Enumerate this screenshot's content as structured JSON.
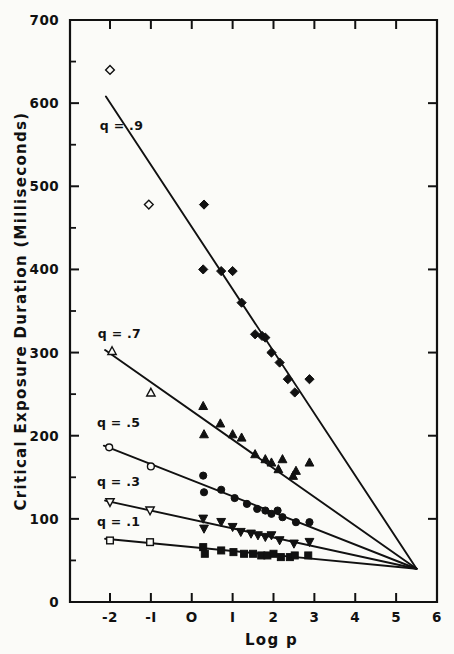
{
  "figure": {
    "background_color": "#fbfbf8",
    "ink_color": "#111111"
  },
  "chart_data": {
    "type": "scatter",
    "title": "",
    "xlabel": "Log p",
    "ylabel": "Critical Exposure Duration (Milliseconds)",
    "xlim": [
      -2.6,
      6.0
    ],
    "ylim": [
      0,
      700
    ],
    "xticks": [
      -2,
      -1,
      0,
      1,
      2,
      3,
      4,
      5,
      6
    ],
    "xticklabels": [
      "-2",
      "-I",
      "O",
      "I",
      "2",
      "3",
      "4",
      "5",
      "6"
    ],
    "yticks": [
      0,
      100,
      200,
      300,
      400,
      500,
      600,
      700
    ],
    "yticklabels": [
      "0",
      "100",
      "200",
      "300",
      "400",
      "500",
      "600",
      "700"
    ],
    "yminorticks": [
      50,
      150,
      250,
      350,
      450,
      550,
      650
    ],
    "grid": false,
    "legend_position": "inline-labels",
    "convergence_point": [
      5.5,
      40
    ],
    "series": [
      {
        "name": "q = .9",
        "label": "q = .9",
        "marker": "diamond",
        "label_x": -2.25,
        "label_y": 568,
        "line": [
          [
            -2.1,
            608
          ],
          [
            5.5,
            40
          ]
        ],
        "open_points": [
          [
            -2.0,
            640
          ],
          [
            -1.05,
            478
          ]
        ],
        "filled_points": [
          [
            0.3,
            478
          ],
          [
            0.28,
            400
          ],
          [
            0.72,
            398
          ],
          [
            1.0,
            398
          ],
          [
            1.22,
            360
          ],
          [
            1.55,
            322
          ],
          [
            1.72,
            320
          ],
          [
            1.8,
            318
          ],
          [
            1.95,
            300
          ],
          [
            2.15,
            288
          ],
          [
            2.35,
            268
          ],
          [
            2.52,
            252
          ],
          [
            2.88,
            268
          ]
        ]
      },
      {
        "name": "q = .7",
        "label": "q = .7",
        "marker": "triangle-up",
        "label_x": -2.3,
        "label_y": 318,
        "line": [
          [
            -2.12,
            303
          ],
          [
            5.5,
            40
          ]
        ],
        "open_points": [
          [
            -1.95,
            302
          ],
          [
            -1.0,
            252
          ]
        ],
        "filled_points": [
          [
            0.28,
            236
          ],
          [
            0.3,
            202
          ],
          [
            0.7,
            215
          ],
          [
            1.0,
            202
          ],
          [
            1.22,
            198
          ],
          [
            1.55,
            178
          ],
          [
            1.8,
            172
          ],
          [
            1.95,
            168
          ],
          [
            2.12,
            160
          ],
          [
            2.22,
            172
          ],
          [
            2.48,
            152
          ],
          [
            2.55,
            158
          ],
          [
            2.88,
            168
          ]
        ]
      },
      {
        "name": "q = .5",
        "label": "q = .5",
        "marker": "circle",
        "label_x": -2.32,
        "label_y": 210,
        "line": [
          [
            -2.15,
            188
          ],
          [
            5.5,
            40
          ]
        ],
        "open_points": [
          [
            -2.02,
            186
          ],
          [
            -1.0,
            163
          ]
        ],
        "filled_points": [
          [
            0.28,
            152
          ],
          [
            0.3,
            132
          ],
          [
            0.72,
            135
          ],
          [
            1.05,
            125
          ],
          [
            1.35,
            118
          ],
          [
            1.6,
            112
          ],
          [
            1.8,
            110
          ],
          [
            1.95,
            106
          ],
          [
            2.1,
            110
          ],
          [
            2.22,
            102
          ],
          [
            2.55,
            96
          ],
          [
            2.88,
            96
          ]
        ]
      },
      {
        "name": "q = .3",
        "label": "q = .3",
        "marker": "triangle-down",
        "label_x": -2.32,
        "label_y": 140,
        "line": [
          [
            -2.12,
            122
          ],
          [
            5.5,
            40
          ]
        ],
        "open_points": [
          [
            -2.0,
            120
          ],
          [
            -1.02,
            110
          ]
        ],
        "filled_points": [
          [
            0.28,
            100
          ],
          [
            0.3,
            88
          ],
          [
            0.72,
            96
          ],
          [
            1.0,
            90
          ],
          [
            1.2,
            84
          ],
          [
            1.45,
            82
          ],
          [
            1.62,
            80
          ],
          [
            1.8,
            78
          ],
          [
            1.95,
            80
          ],
          [
            2.15,
            74
          ],
          [
            2.5,
            70
          ],
          [
            2.88,
            72
          ]
        ]
      },
      {
        "name": "q = .1",
        "label": "q = .1",
        "marker": "square",
        "label_x": -2.32,
        "label_y": 92,
        "line": [
          [
            -2.12,
            76
          ],
          [
            5.5,
            40
          ]
        ],
        "open_points": [
          [
            -2.0,
            74
          ],
          [
            -1.02,
            72
          ]
        ],
        "filled_points": [
          [
            0.28,
            66
          ],
          [
            0.32,
            58
          ],
          [
            0.72,
            62
          ],
          [
            1.02,
            60
          ],
          [
            1.28,
            58
          ],
          [
            1.5,
            58
          ],
          [
            1.7,
            56
          ],
          [
            1.85,
            56
          ],
          [
            2.0,
            58
          ],
          [
            2.18,
            54
          ],
          [
            2.4,
            54
          ],
          [
            2.52,
            56
          ],
          [
            2.85,
            56
          ]
        ]
      }
    ]
  }
}
